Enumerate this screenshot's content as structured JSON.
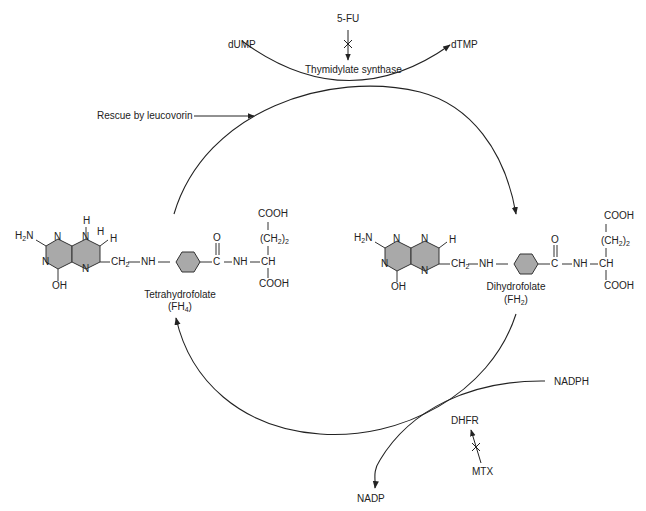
{
  "diagram": {
    "type": "metabolic-cycle",
    "nodes": {
      "dump": "dUMP",
      "dtmp": "dTMP",
      "five_fu": "5-FU",
      "thymidylate_synthase": "Thymidylate synthase",
      "rescue": "Rescue by leucovorin",
      "nadph": "NADPH",
      "nadp": "NADP",
      "dhfr": "DHFR",
      "mtx": "MTX"
    },
    "tetrahydrofolate": {
      "name": "Tetrahydrofolate",
      "abbr_prefix": "(FH",
      "abbr_sub": "4",
      "abbr_suffix": ")"
    },
    "dihydrofolate": {
      "name": "Dihydrofolate",
      "abbr_prefix": "(FH",
      "abbr_sub": "2",
      "abbr_suffix": ")"
    },
    "atoms": {
      "h2n_h": "H",
      "h2n_sub": "2",
      "h2n_n": "N",
      "N": "N",
      "H": "H",
      "OH": "OH",
      "ch2_c": "CH",
      "ch2_sub": "2",
      "NH": "NH",
      "O": "O",
      "C": "C",
      "CH": "CH",
      "COOH": "COOH",
      "ch2_2_open": "(CH",
      "ch2_2_sub": "2",
      "ch2_2_close": ")",
      "ch2_2_n": "2"
    },
    "edges": [
      {
        "from": "dUMP",
        "to": "dTMP",
        "label": "Thymidylate synthase"
      },
      {
        "from": "5-FU",
        "to": "Thymidylate synthase",
        "inhibits": true
      },
      {
        "from": "Rescue by leucovorin",
        "to": "cycle"
      },
      {
        "from": "Tetrahydrofolate",
        "to": "Dihydrofolate"
      },
      {
        "from": "Dihydrofolate",
        "to": "Tetrahydrofolate",
        "enzyme": "DHFR"
      },
      {
        "from": "NADPH",
        "to": "NADP"
      },
      {
        "from": "MTX",
        "to": "DHFR",
        "inhibits": true
      }
    ],
    "colors": {
      "line": "#222222",
      "ring_fill": "#a9a9a9",
      "ring_stroke": "#333333"
    }
  }
}
